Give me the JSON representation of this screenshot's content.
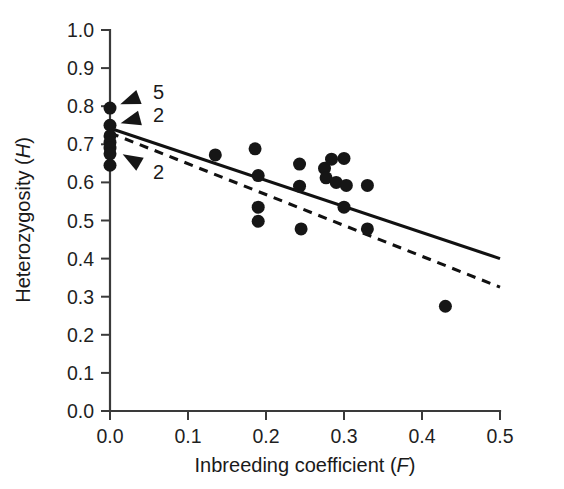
{
  "chart_data": {
    "type": "scatter",
    "title": "",
    "xlabel": "Inbreeding coefficient (F)",
    "xlabel_plain": "Inbreeding coefficient (",
    "xlabel_italic": "F",
    "xlabel_tail": ")",
    "ylabel": "Heterozygosity (H)",
    "ylabel_plain": "Heterozygosity (",
    "ylabel_italic": "H",
    "ylabel_tail": ")",
    "xlim": [
      0.0,
      0.5
    ],
    "ylim": [
      0.0,
      1.0
    ],
    "grid": false,
    "legend": "none",
    "xticks": [
      0.0,
      0.1,
      0.2,
      0.3,
      0.4,
      0.5
    ],
    "xtick_labels": [
      "0.0",
      "0.1",
      "0.2",
      "0.3",
      "0.4",
      "0.5"
    ],
    "yticks": [
      0.0,
      0.1,
      0.2,
      0.3,
      0.4,
      0.5,
      0.6,
      0.7,
      0.8,
      0.9,
      1.0
    ],
    "ytick_labels": [
      "0.0",
      "0.1",
      "0.2",
      "0.3",
      "0.4",
      "0.5",
      "0.6",
      "0.7",
      "0.8",
      "0.9",
      "1.0"
    ],
    "marker_color": "#161616",
    "marker_size_px": 13,
    "points": [
      {
        "x": 0.0,
        "y": 0.795
      },
      {
        "x": 0.0,
        "y": 0.75
      },
      {
        "x": 0.0,
        "y": 0.722
      },
      {
        "x": 0.0,
        "y": 0.705
      },
      {
        "x": 0.0,
        "y": 0.69
      },
      {
        "x": 0.0,
        "y": 0.675
      },
      {
        "x": 0.0,
        "y": 0.645
      },
      {
        "x": 0.135,
        "y": 0.672
      },
      {
        "x": 0.186,
        "y": 0.688
      },
      {
        "x": 0.19,
        "y": 0.618
      },
      {
        "x": 0.19,
        "y": 0.535
      },
      {
        "x": 0.19,
        "y": 0.498
      },
      {
        "x": 0.243,
        "y": 0.648
      },
      {
        "x": 0.243,
        "y": 0.59
      },
      {
        "x": 0.245,
        "y": 0.478
      },
      {
        "x": 0.275,
        "y": 0.637
      },
      {
        "x": 0.277,
        "y": 0.612
      },
      {
        "x": 0.284,
        "y": 0.661
      },
      {
        "x": 0.29,
        "y": 0.6
      },
      {
        "x": 0.3,
        "y": 0.663
      },
      {
        "x": 0.303,
        "y": 0.592
      },
      {
        "x": 0.3,
        "y": 0.535
      },
      {
        "x": 0.33,
        "y": 0.592
      },
      {
        "x": 0.33,
        "y": 0.478
      },
      {
        "x": 0.43,
        "y": 0.275
      }
    ],
    "lines": [
      {
        "name": "solid-regression-line",
        "style": "solid",
        "x_start": 0.0,
        "y_start": 0.742,
        "x_end": 0.5,
        "y_end": 0.4
      },
      {
        "name": "dashed-regression-line",
        "style": "dashed",
        "x_start": 0.0,
        "y_start": 0.73,
        "x_end": 0.5,
        "y_end": 0.325
      }
    ],
    "annotations": [
      {
        "label": "5",
        "tip_x": 0.0,
        "tip_y": 0.795,
        "text_x": 0.055,
        "text_y": 0.838
      },
      {
        "label": "2",
        "tip_x": 0.0,
        "tip_y": 0.748,
        "text_x": 0.055,
        "text_y": 0.778
      },
      {
        "label": "2",
        "tip_x": 0.004,
        "tip_y": 0.688,
        "text_x": 0.055,
        "text_y": 0.628
      }
    ]
  }
}
